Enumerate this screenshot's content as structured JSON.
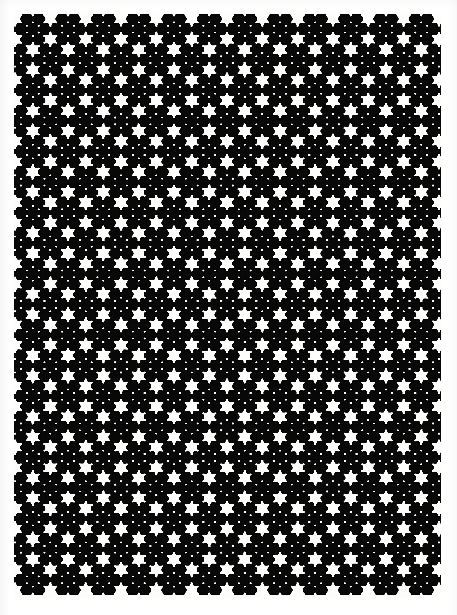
{
  "figure": {
    "domain": "Natural-Image",
    "kind": "scanned-fractal-plate",
    "title": "",
    "caption": "",
    "ink_color": "#0a0a0a",
    "paper_color": "#fdfdfc",
    "page_background": "#ffffff"
  },
  "scan": {
    "width": 457,
    "height": 615,
    "margin_left": 14,
    "margin_top": 12,
    "margin_right": 17,
    "margin_bottom": 18,
    "edge_shadow": true
  },
  "fractal": {
    "name": "hexaflake-snowflake-attractor",
    "type": "iterated-function-system",
    "symmetry_order": 6,
    "motif": "six-pointed snowflake",
    "iterations": 7,
    "contraction_ratio": 0.3333,
    "branch_count": 7,
    "dot_radius_px": 0.62,
    "ink": "#0b0b0b",
    "viewport": {
      "x": 14,
      "y": 12,
      "width": 426,
      "height": 585
    },
    "domain_extent": {
      "xmin": -1.34,
      "xmax": 1.34,
      "ymin": -1.72,
      "ymax": 1.72
    },
    "seed_maps": [
      {
        "s": 0.3333,
        "angle_deg": 0,
        "tx": 0.0,
        "ty": 0.0
      },
      {
        "s": 0.3333,
        "angle_deg": 0,
        "tx": 0.6667,
        "ty": 0.0
      },
      {
        "s": 0.3333,
        "angle_deg": 0,
        "tx": 0.3333,
        "ty": 0.5774
      },
      {
        "s": 0.3333,
        "angle_deg": 0,
        "tx": -0.3333,
        "ty": 0.5774
      },
      {
        "s": 0.3333,
        "angle_deg": 0,
        "tx": -0.6667,
        "ty": 0.0
      },
      {
        "s": 0.3333,
        "angle_deg": 0,
        "tx": -0.3333,
        "ty": -0.5774
      },
      {
        "s": 0.3333,
        "angle_deg": 0,
        "tx": 0.3333,
        "ty": -0.5774
      }
    ],
    "tiling": {
      "mode": "hex-lattice-overlay",
      "cells_x": 3,
      "cells_y": 4,
      "cell_rotation_deg": 0,
      "cell_scale": 1.0,
      "offsets": [
        {
          "x": 0.0,
          "y": 0.0
        },
        {
          "x": 0.0,
          "y": -1.1547
        },
        {
          "x": 0.0,
          "y": 1.1547
        },
        {
          "x": 1.0,
          "y": -0.5774
        },
        {
          "x": 1.0,
          "y": 0.5774
        },
        {
          "x": -1.0,
          "y": -0.5774
        },
        {
          "x": -1.0,
          "y": 0.5774
        },
        {
          "x": 2.0,
          "y": 0.0
        },
        {
          "x": -2.0,
          "y": 0.0
        },
        {
          "x": 1.0,
          "y": 1.7321
        },
        {
          "x": -1.0,
          "y": 1.7321
        },
        {
          "x": 1.0,
          "y": -1.7321
        },
        {
          "x": -1.0,
          "y": -1.7321
        },
        {
          "x": 2.0,
          "y": 1.1547
        },
        {
          "x": -2.0,
          "y": 1.1547
        },
        {
          "x": 2.0,
          "y": -1.1547
        },
        {
          "x": -2.0,
          "y": -1.1547
        },
        {
          "x": 0.0,
          "y": 2.3094
        },
        {
          "x": 0.0,
          "y": -2.3094
        },
        {
          "x": 2.0,
          "y": 2.3094
        },
        {
          "x": -2.0,
          "y": 2.3094
        },
        {
          "x": 2.0,
          "y": -2.3094
        },
        {
          "x": -2.0,
          "y": -2.3094
        },
        {
          "x": 1.0,
          "y": 2.8868
        },
        {
          "x": -1.0,
          "y": 2.8868
        },
        {
          "x": 1.0,
          "y": -2.8868
        },
        {
          "x": -1.0,
          "y": -2.8868
        },
        {
          "x": 3.0,
          "y": 0.5774
        },
        {
          "x": -3.0,
          "y": 0.5774
        },
        {
          "x": 3.0,
          "y": -0.5774
        },
        {
          "x": -3.0,
          "y": -0.5774
        },
        {
          "x": 3.0,
          "y": 1.7321
        },
        {
          "x": -3.0,
          "y": 1.7321
        },
        {
          "x": 3.0,
          "y": -1.7321
        },
        {
          "x": -3.0,
          "y": -1.7321
        },
        {
          "x": 0.0,
          "y": 3.4641
        },
        {
          "x": 0.0,
          "y": -3.4641
        },
        {
          "x": 2.0,
          "y": 3.4641
        },
        {
          "x": -2.0,
          "y": 3.4641
        },
        {
          "x": 2.0,
          "y": -3.4641
        },
        {
          "x": -2.0,
          "y": -3.4641
        }
      ]
    }
  }
}
